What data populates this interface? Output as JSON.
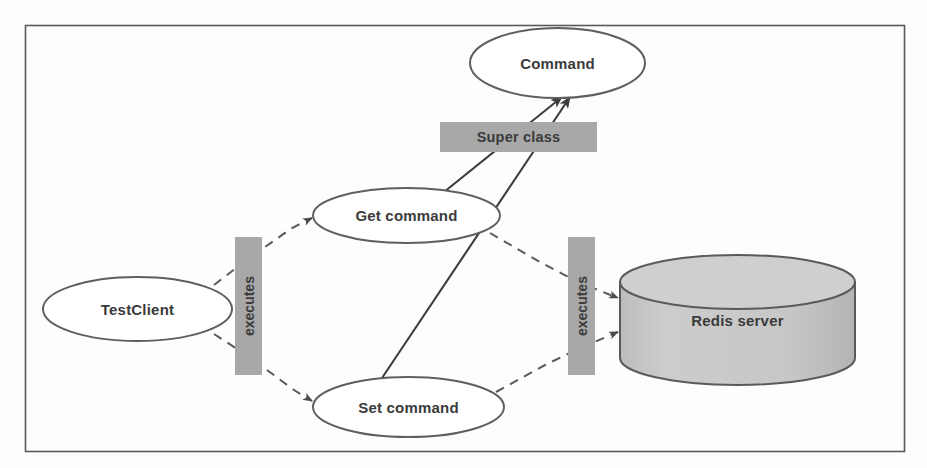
{
  "diagram": {
    "type": "class-interaction-diagram",
    "canvas": {
      "width": 927,
      "height": 468
    },
    "frame": {
      "x": 25,
      "y": 25,
      "width": 880,
      "height": 427,
      "stroke": "#555555"
    },
    "colors": {
      "label_box_fill": "#a8a8a8",
      "cylinder_fill": "#c6c6c6",
      "node_fill": "#ffffff",
      "node_stroke": "#595959",
      "text": "#3b3b3b",
      "solid_edge": "#3d3d3d",
      "dashed_edge": "#5a5a5a"
    },
    "nodes": [
      {
        "id": "command",
        "label": "Command",
        "shape": "ellipse",
        "cx": 557.5,
        "cy": 63,
        "rx": 87.5,
        "ry": 35
      },
      {
        "id": "get-command",
        "label": "Get command",
        "shape": "ellipse",
        "cx": 406.5,
        "cy": 215.5,
        "rx": 93.5,
        "ry": 27.5
      },
      {
        "id": "set-command",
        "label": "Set command",
        "shape": "ellipse",
        "cx": 408.5,
        "cy": 407,
        "rx": 95.5,
        "ry": 30
      },
      {
        "id": "test-client",
        "label": "TestClient",
        "shape": "ellipse",
        "cx": 137.5,
        "cy": 309,
        "rx": 94.5,
        "ry": 32
      },
      {
        "id": "redis-server",
        "label": "Redis server",
        "shape": "cylinder",
        "x": 620,
        "y": 255,
        "width": 235,
        "height": 130
      }
    ],
    "edge_labels": [
      {
        "id": "super-class",
        "label": "Super class",
        "orientation": "horizontal",
        "x": 440,
        "y": 122,
        "width": 157,
        "height": 30
      },
      {
        "id": "executes-left",
        "label": "executes",
        "orientation": "vertical",
        "x": 235,
        "y": 237,
        "width": 27,
        "height": 138
      },
      {
        "id": "executes-right",
        "label": "executes",
        "orientation": "vertical",
        "x": 568,
        "y": 237,
        "width": 27,
        "height": 138
      }
    ],
    "edges": [
      {
        "id": "get-to-command",
        "from": "get-command",
        "to": "command",
        "style": "solid",
        "relation": "inherits"
      },
      {
        "id": "set-to-command",
        "from": "set-command",
        "to": "command",
        "style": "solid",
        "relation": "inherits"
      },
      {
        "id": "client-to-get",
        "from": "test-client",
        "to": "get-command",
        "style": "dashed",
        "relation": "executes"
      },
      {
        "id": "client-to-set",
        "from": "test-client",
        "to": "set-command",
        "style": "dashed",
        "relation": "executes"
      },
      {
        "id": "get-to-redis",
        "from": "get-command",
        "to": "redis-server",
        "style": "dashed",
        "relation": "executes"
      },
      {
        "id": "set-to-redis",
        "from": "set-command",
        "to": "redis-server",
        "style": "dashed",
        "relation": "executes"
      }
    ]
  }
}
